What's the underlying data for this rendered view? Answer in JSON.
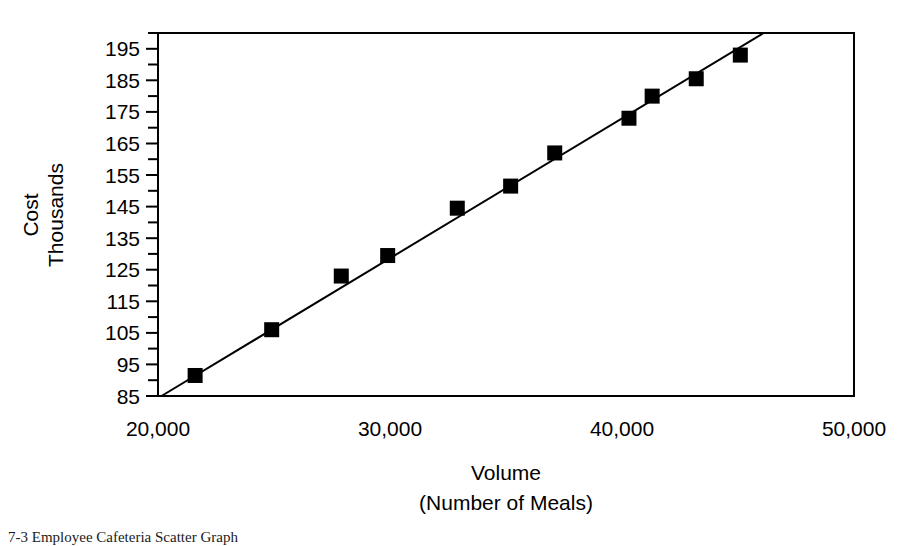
{
  "chart_data": {
    "type": "scatter",
    "title": "",
    "xlabel": "Volume",
    "xlabel_line2": "(Number of Meals)",
    "ylabel": "Cost",
    "ylabel_line2": "Thousands",
    "xlim": [
      20000,
      50000
    ],
    "ylim": [
      85,
      200
    ],
    "grid": false,
    "legend": null,
    "x_tick_labels": [
      "20,000",
      "30,000",
      "40,000",
      "50,000"
    ],
    "x_tick_values": [
      20000,
      30000,
      40000,
      50000
    ],
    "y_tick_labels": [
      "85",
      "95",
      "105",
      "115",
      "125",
      "135",
      "145",
      "155",
      "165",
      "175",
      "185",
      "195"
    ],
    "y_tick_values": [
      85,
      95,
      105,
      115,
      125,
      135,
      145,
      155,
      165,
      175,
      185,
      195
    ],
    "y_minor_tick_values": [
      90,
      100,
      110,
      120,
      130,
      140,
      150,
      160,
      170,
      180,
      190,
      200
    ],
    "marker_style": "filled-square",
    "marker_color": "#000000",
    "points": [
      {
        "x": 21600,
        "y": 91.5
      },
      {
        "x": 24900,
        "y": 106.0
      },
      {
        "x": 27900,
        "y": 123.0
      },
      {
        "x": 29900,
        "y": 129.5
      },
      {
        "x": 32900,
        "y": 144.5
      },
      {
        "x": 35200,
        "y": 151.5
      },
      {
        "x": 37100,
        "y": 162.0
      },
      {
        "x": 40300,
        "y": 173.0
      },
      {
        "x": 41300,
        "y": 180.0
      },
      {
        "x": 43200,
        "y": 185.5
      },
      {
        "x": 45100,
        "y": 193.0
      }
    ],
    "series": [
      {
        "name": "Cost observations",
        "x": [
          21600,
          24900,
          27900,
          29900,
          32900,
          35200,
          37100,
          40300,
          41300,
          43200,
          45100
        ],
        "values": [
          91.5,
          106.0,
          123.0,
          129.5,
          144.5,
          151.5,
          162.0,
          173.0,
          180.0,
          185.5,
          193.0
        ]
      }
    ],
    "trend_line": {
      "type": "linear-fit",
      "from": {
        "x": 20150,
        "y": 85.0
      },
      "to": {
        "x": 46100,
        "y": 200.0
      }
    }
  },
  "axes": {
    "y_title_line1": "Cost",
    "y_title_line2": "Thousands",
    "x_title_line1": "Volume",
    "x_title_line2": "(Number of Meals)"
  },
  "caption": {
    "text": "7-3  Employee Cafeteria Scatter Graph"
  }
}
